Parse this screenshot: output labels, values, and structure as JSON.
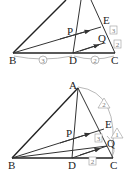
{
  "figure_top": {
    "points": {
      "B": {
        "label": "B",
        "x": 13,
        "y": 53
      },
      "D": {
        "label": "D",
        "x": 73,
        "y": 53
      },
      "C": {
        "label": "C",
        "x": 115,
        "y": 53
      },
      "E": {
        "label": "E",
        "x": 101,
        "y": 25
      },
      "P": {
        "label": "P",
        "x": 75,
        "y": 33
      },
      "Q": {
        "label": "Q",
        "x": 104,
        "y": 42
      }
    },
    "ratio_labels": {
      "BD": "3",
      "DC": "2",
      "EQ": "3",
      "QC": "2"
    }
  },
  "figure_bottom": {
    "points": {
      "A": {
        "label": "A",
        "x": 78,
        "y": 87
      },
      "B": {
        "label": "B",
        "x": 12,
        "y": 158
      },
      "D": {
        "label": "D",
        "x": 72,
        "y": 158
      },
      "C": {
        "label": "C",
        "x": 113,
        "y": 158
      },
      "E": {
        "label": "E",
        "x": 104,
        "y": 127
      },
      "P": {
        "label": "P",
        "x": 73,
        "y": 140
      },
      "Q": {
        "label": "Q",
        "x": 107,
        "y": 143
      }
    },
    "ratio_labels": {
      "AE": "2",
      "EC": "1",
      "EQ_box": "3",
      "DC_box": "2"
    }
  }
}
